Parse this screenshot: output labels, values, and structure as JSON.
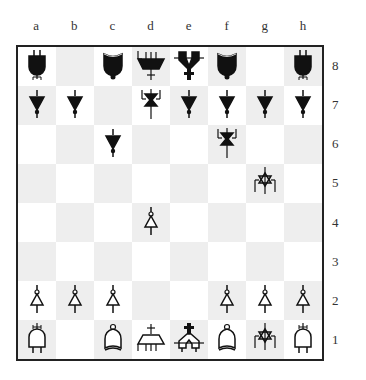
{
  "board": {
    "files": [
      "a",
      "b",
      "c",
      "d",
      "e",
      "f",
      "g",
      "h"
    ],
    "ranks": [
      "8",
      "7",
      "6",
      "5",
      "4",
      "3",
      "2",
      "1"
    ],
    "colors": {
      "light_square": "#ffffff",
      "dark_square": "#eeeeee",
      "border": "#222222",
      "black_piece": "#111111",
      "white_piece": "#ffffff"
    },
    "squares": [
      [
        "bR",
        "",
        "bB",
        "bQ",
        "bK",
        "bB",
        "",
        "bR"
      ],
      [
        "bP",
        "bP",
        "",
        "bN",
        "bP",
        "bP",
        "bP",
        "bP"
      ],
      [
        "",
        "",
        "bP",
        "",
        "",
        "bN",
        "",
        ""
      ],
      [
        "",
        "",
        "",
        "",
        "",
        "",
        "wN",
        ""
      ],
      [
        "",
        "",
        "",
        "wP",
        "",
        "",
        "",
        ""
      ],
      [
        "",
        "",
        "",
        "",
        "",
        "",
        "",
        ""
      ],
      [
        "wP",
        "wP",
        "wP",
        "",
        "",
        "wP",
        "wP",
        "wP"
      ],
      [
        "wR",
        "",
        "wB",
        "wQ",
        "wK",
        "wB",
        "wN",
        "wR"
      ]
    ]
  },
  "piece_names": {
    "P": "pawn",
    "R": "rook",
    "N": "knight",
    "B": "bishop",
    "Q": "queen",
    "K": "king"
  }
}
